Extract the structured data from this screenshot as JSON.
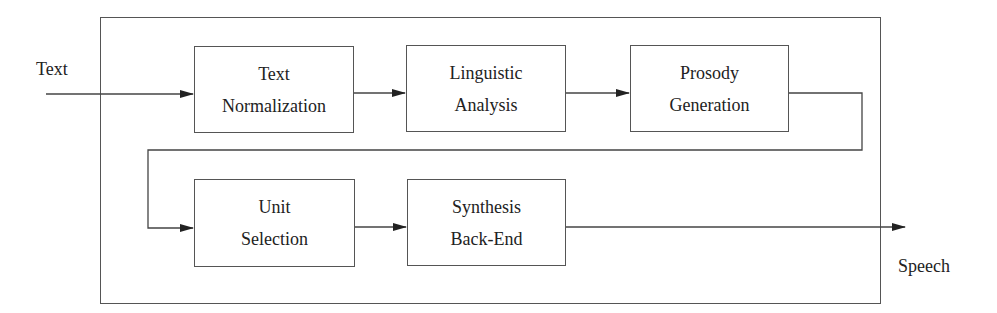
{
  "diagram": {
    "input_label": "Text",
    "output_label": "Speech",
    "blocks": [
      {
        "id": "text-normalization",
        "line1": "Text",
        "line2": "Normalization"
      },
      {
        "id": "linguistic-analysis",
        "line1": "Linguistic",
        "line2": "Analysis"
      },
      {
        "id": "prosody-generation",
        "line1": "Prosody",
        "line2": "Generation"
      },
      {
        "id": "unit-selection",
        "line1": "Unit",
        "line2": "Selection"
      },
      {
        "id": "synthesis-back-end",
        "line1": "Synthesis",
        "line2": "Back-End"
      }
    ],
    "colors": {
      "stroke": "#555555",
      "text": "#222222",
      "background": "#ffffff"
    }
  }
}
